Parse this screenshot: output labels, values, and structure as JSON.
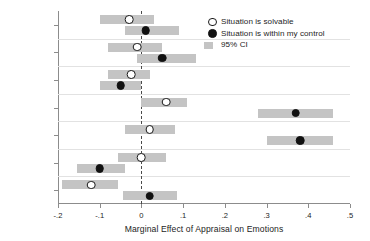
{
  "chart_data": {
    "type": "bar",
    "title": "",
    "xlabel": "Marginal Effect of Appraisal on Emotions",
    "ylabel": "",
    "xlim": [
      -0.2,
      0.5
    ],
    "xticks": [
      -0.2,
      -0.1,
      0,
      0.1,
      0.2,
      0.3,
      0.4,
      0.5
    ],
    "xticklabels": [
      "-.2",
      "-.1",
      "0",
      ".1",
      ".2",
      ".3",
      ".4",
      ".5"
    ],
    "categories": [
      "Afraid",
      "Anxious",
      "Angry",
      "Hopeful",
      "Happy",
      "Disappointed",
      "Depressed"
    ],
    "grid": false,
    "reference_line": 0,
    "legend_position": "upper right",
    "series": [
      {
        "name": "Situation is solvable",
        "marker": "open-circle",
        "values": [
          -0.03,
          -0.01,
          -0.025,
          0.06,
          0.02,
          0.0,
          -0.12
        ],
        "ci_low": [
          -0.1,
          -0.08,
          -0.08,
          0.0,
          -0.04,
          -0.055,
          -0.19
        ],
        "ci_high": [
          0.03,
          0.05,
          0.02,
          0.11,
          0.08,
          0.06,
          -0.055
        ]
      },
      {
        "name": "Situation is within my control",
        "marker": "filled-circle",
        "values": [
          0.01,
          0.05,
          -0.05,
          0.37,
          0.38,
          -0.1,
          0.02
        ],
        "ci_low": [
          -0.04,
          -0.01,
          -0.1,
          0.28,
          0.3,
          -0.155,
          -0.045
        ],
        "ci_high": [
          0.09,
          0.13,
          0.0,
          0.46,
          0.46,
          -0.04,
          0.085
        ]
      }
    ]
  },
  "legend": {
    "entries": [
      {
        "label": "Situation is solvable",
        "key": "open-circle"
      },
      {
        "label": "Situation is within my control",
        "key": "filled-circle"
      },
      {
        "label": "95% CI",
        "key": "swatch"
      }
    ]
  },
  "colors": {
    "ci_bar": "#c4c4c4",
    "marker_fill": "#111111",
    "marker_open": "#ffffff",
    "axis": "#8c8c8c",
    "zero_line": "#4a4a4a",
    "text": "#1d1d1d",
    "separator": "#e2e2e2",
    "background": "#ffffff"
  }
}
